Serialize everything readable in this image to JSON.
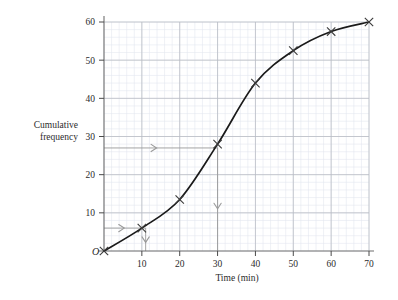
{
  "chart_data": {
    "type": "line",
    "title": "",
    "xlabel": "Time (min)",
    "ylabel": "Cumulative frequency",
    "ylabel_line1": "Cumulative",
    "ylabel_line2": "frequency",
    "origin_label": "O",
    "xlim": [
      0,
      70
    ],
    "ylim": [
      0,
      60
    ],
    "x_ticks": [
      10,
      20,
      30,
      40,
      50,
      60,
      70
    ],
    "x_tick_labels": [
      "10",
      "20",
      "30",
      "40",
      "50",
      "60",
      "70"
    ],
    "y_ticks": [
      10,
      20,
      30,
      40,
      50,
      60
    ],
    "y_tick_labels": [
      "10",
      "20",
      "30",
      "40",
      "50",
      "60"
    ],
    "x_minor_step": 2,
    "y_minor_step": 2,
    "grid": true,
    "grid_major_color": "#b9bcc4",
    "grid_minor_color": "#e2e6ef",
    "curve_color": "#1a1a1a",
    "marker": "x",
    "marker_color": "#3a3a3a",
    "construction_color": "#9a9a9a",
    "x": [
      0,
      10,
      20,
      30,
      40,
      50,
      60,
      70
    ],
    "values": [
      0,
      6,
      13.5,
      28,
      44,
      52.5,
      57.5,
      60
    ],
    "points": [
      {
        "x": 0,
        "y": 0
      },
      {
        "x": 10,
        "y": 6
      },
      {
        "x": 20,
        "y": 13.5
      },
      {
        "x": 30,
        "y": 28
      },
      {
        "x": 40,
        "y": 44
      },
      {
        "x": 50,
        "y": 52.5
      },
      {
        "x": 60,
        "y": 57.5
      },
      {
        "x": 70,
        "y": 60
      }
    ],
    "annotations": [
      {
        "name": "median-read-off",
        "type": "construction-lines",
        "from_y": 27,
        "to_x": 30,
        "direction": "right-then-down"
      },
      {
        "name": "lower-read-off",
        "type": "construction-lines",
        "from_y": 6,
        "to_x": 11,
        "direction": "right-then-down"
      }
    ]
  }
}
